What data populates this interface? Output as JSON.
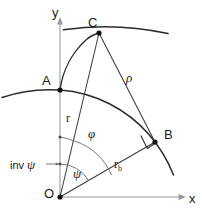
{
  "figure": {
    "type": "geometry-diagram",
    "background_color": "#ffffff",
    "stroke_color": "#262626",
    "axis_color": "#8c8c8c",
    "text_color": "#1a1a1a"
  },
  "axes": {
    "x_label": "x",
    "y_label": "y",
    "origin_label": "O"
  },
  "points": [
    {
      "id": "O",
      "label": "O",
      "x": 60,
      "y": 197
    },
    {
      "id": "A",
      "label": "A",
      "x": 60,
      "y": 90
    },
    {
      "id": "B",
      "label": "B",
      "x": 155,
      "y": 142
    },
    {
      "id": "C",
      "label": "C",
      "x": 99,
      "y": 33
    }
  ],
  "segments": [
    {
      "id": "OC",
      "label": "r",
      "from": "O",
      "to": "C"
    },
    {
      "id": "OB",
      "label": "r_b",
      "from": "O",
      "to": "B"
    },
    {
      "id": "CB",
      "label": "rho",
      "from": "C",
      "to": "B"
    }
  ],
  "labels": {
    "r": "r",
    "r_b_base": "r",
    "r_b_sub": "b",
    "rho": "ρ",
    "phi": "φ",
    "psi": "ψ",
    "inv_psi_word": "inv",
    "inv_psi_symbol": "ψ",
    "point_a": "A",
    "point_b": "B",
    "point_c": "C",
    "point_o": "O",
    "axis_x": "x",
    "axis_y": "y"
  },
  "angles": [
    {
      "id": "phi",
      "label": "φ",
      "vertex": "O",
      "between": [
        "y-axis",
        "OC"
      ],
      "description": "roll angle from y-axis to radius OC"
    },
    {
      "id": "psi",
      "label": "ψ",
      "vertex": "O",
      "between": [
        "y-axis",
        "OB"
      ],
      "description": "angle from y-axis to base radius OB"
    },
    {
      "id": "inv_psi",
      "label": "inv ψ",
      "vertex": "O",
      "between": [
        "OC",
        "OB"
      ],
      "description": "involute function angle between OC and OB"
    }
  ],
  "markers": {
    "right_angle_at": "B",
    "right_angle_label": ""
  },
  "arcs": [
    {
      "id": "outer-arc",
      "description": "outer circle arc through C",
      "kind": "circle-arc"
    },
    {
      "id": "base-arc",
      "description": "base circle arc through A and B",
      "kind": "circle-arc"
    },
    {
      "id": "involute",
      "description": "involute curve from A to C",
      "kind": "involute"
    }
  ]
}
